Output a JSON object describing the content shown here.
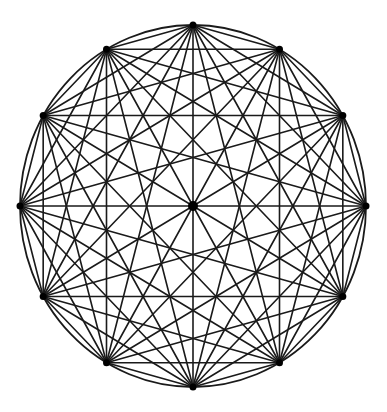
{
  "diagram": {
    "type": "complete-graph-on-circle",
    "vertex_count": 12,
    "center": {
      "x": 193,
      "y": 206
    },
    "radius_x": 173,
    "radius_y": 181,
    "start_angle_deg": 90,
    "connect_all_pairs": true,
    "draw_outline": true,
    "vertex_dot_radius": 3.5,
    "center_dot_radius": 5,
    "show_center_dot": true,
    "colors": {
      "background": "#ffffff",
      "stroke": "#1a1a1a",
      "dots": "#000000"
    }
  }
}
